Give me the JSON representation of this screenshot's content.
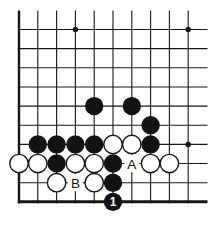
{
  "diagram": {
    "type": "go-board-corner-problem",
    "board_section": "bottom-left corner of 19x19 board, 10x10 visible lines, top and right edges cut off",
    "colors": {
      "background": "#ffffff",
      "line": "#161616",
      "black_stone": "#121212",
      "white_stone": "#ffffff",
      "white_stone_outline": "#161616",
      "label_text": "#121212",
      "move_number_text": "#ffffff"
    },
    "grid": {
      "cols": 10,
      "rows": 10,
      "origin_x": 19,
      "origin_y": 29.5,
      "cell_w": 18.8,
      "cell_h": 19.15,
      "top_overflow": 19,
      "right_overflow": 19.3,
      "thin_line_width": 1.1,
      "left_edge_width": 2.4,
      "bottom_edge_width": 3,
      "star_radius": 2.7,
      "stone_radius": 9.2
    },
    "star_points": [
      {
        "col": 3,
        "row": 0
      },
      {
        "col": 9,
        "row": 0
      },
      {
        "col": 9,
        "row": 6
      }
    ],
    "stones": [
      {
        "col": 4,
        "row": 4,
        "color": "black"
      },
      {
        "col": 6,
        "row": 4,
        "color": "black"
      },
      {
        "col": 7,
        "row": 5,
        "color": "black"
      },
      {
        "col": 1,
        "row": 6,
        "color": "black"
      },
      {
        "col": 2,
        "row": 6,
        "color": "black"
      },
      {
        "col": 3,
        "row": 6,
        "color": "black"
      },
      {
        "col": 4,
        "row": 6,
        "color": "black"
      },
      {
        "col": 5,
        "row": 6,
        "color": "white"
      },
      {
        "col": 6,
        "row": 6,
        "color": "white"
      },
      {
        "col": 7,
        "row": 6,
        "color": "black"
      },
      {
        "col": 0,
        "row": 7,
        "color": "white"
      },
      {
        "col": 1,
        "row": 7,
        "color": "white"
      },
      {
        "col": 2,
        "row": 7,
        "color": "black"
      },
      {
        "col": 3,
        "row": 7,
        "color": "white"
      },
      {
        "col": 4,
        "row": 7,
        "color": "white"
      },
      {
        "col": 5,
        "row": 7,
        "color": "black"
      },
      {
        "col": 7,
        "row": 7,
        "color": "white"
      },
      {
        "col": 8,
        "row": 7,
        "color": "white"
      },
      {
        "col": 2,
        "row": 8,
        "color": "white"
      },
      {
        "col": 4,
        "row": 8,
        "color": "white"
      },
      {
        "col": 5,
        "row": 8,
        "color": "black"
      }
    ],
    "point_labels": [
      {
        "col": 6,
        "row": 7,
        "text": "A"
      },
      {
        "col": 3,
        "row": 8,
        "text": "B"
      }
    ],
    "marked_move": {
      "col": 5,
      "row": 9,
      "color": "black",
      "number": "1"
    }
  }
}
